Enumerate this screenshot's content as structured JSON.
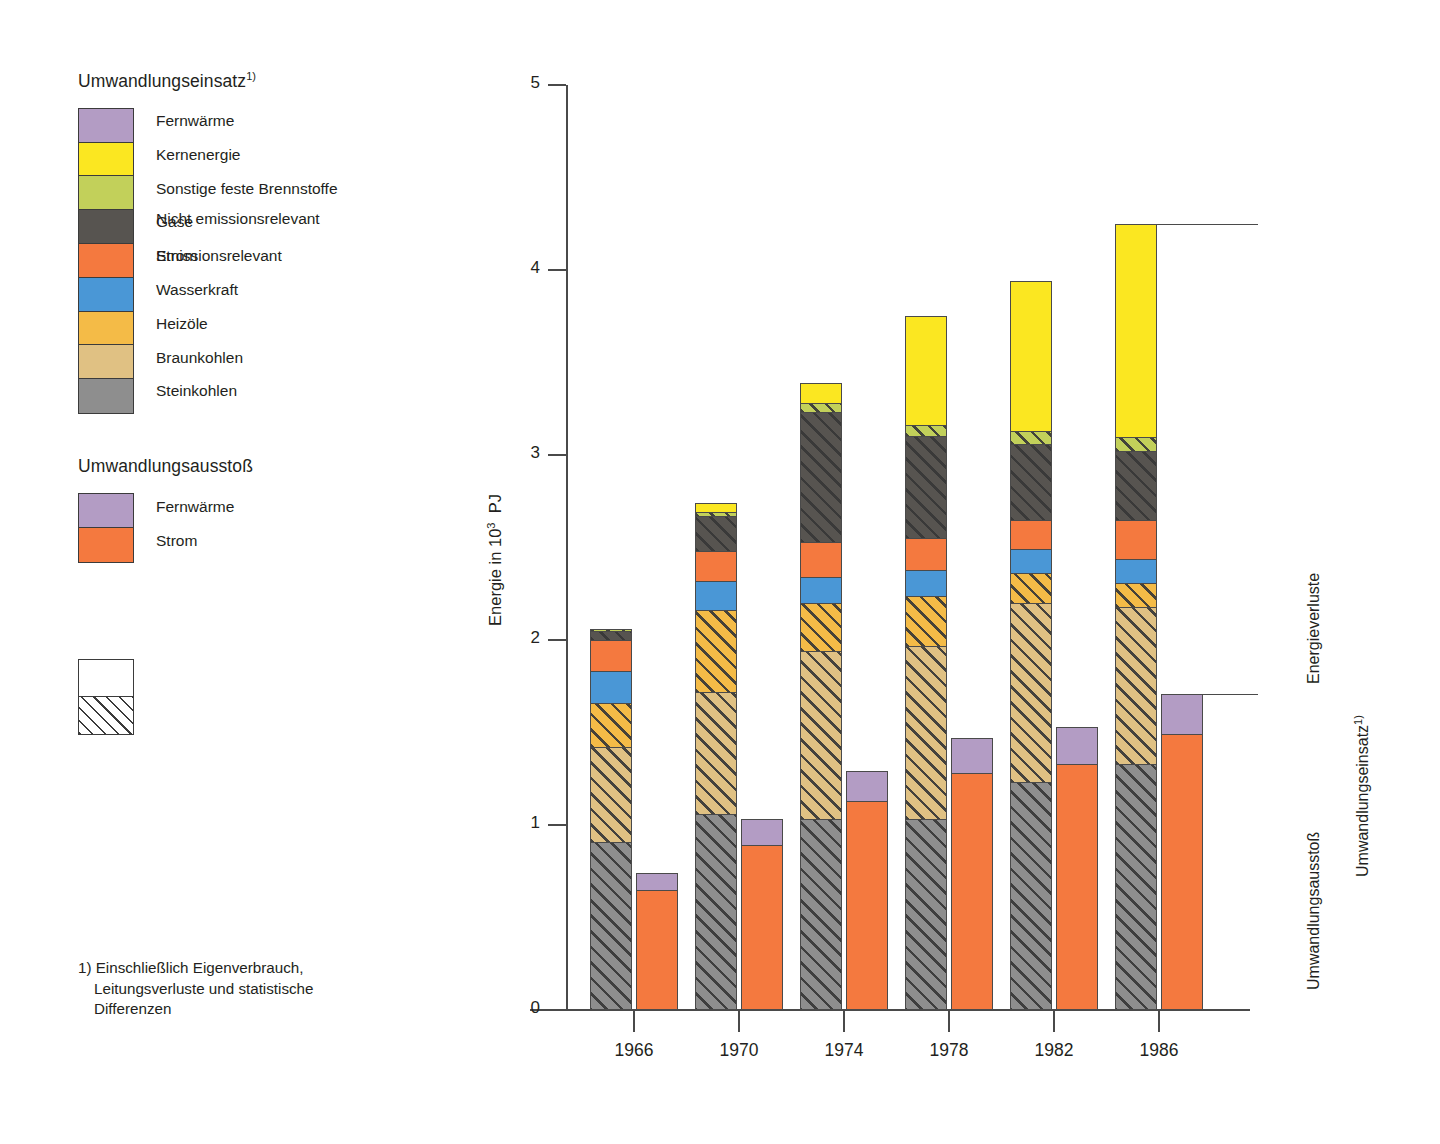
{
  "legend": {
    "group1_title": "Umwandlungseinsatz",
    "group1_title_sup": "1)",
    "group1_items": [
      {
        "label": "Fernwärme",
        "color": "#b39cc4"
      },
      {
        "label": "Kernenergie",
        "color": "#fbe721"
      },
      {
        "label": "Sonstige feste Brennstoffe",
        "color": "#c2d05a"
      },
      {
        "label": "Gase",
        "color": "#575450"
      },
      {
        "label": "Strom",
        "color": "#f4793f"
      },
      {
        "label": "Wasserkraft",
        "color": "#4a97d6"
      },
      {
        "label": "Heizöle",
        "color": "#f4bb47"
      },
      {
        "label": "Braunkohlen",
        "color": "#e0c183"
      },
      {
        "label": "Steinkohlen",
        "color": "#8e8e8e"
      }
    ],
    "group2_title": "Umwandlungsausstoß",
    "group2_items": [
      {
        "label": "Fernwärme",
        "color": "#b39cc4"
      },
      {
        "label": "Strom",
        "color": "#f4793f"
      }
    ],
    "pattern_items": [
      {
        "label": "Nicht emissionsrelevant",
        "pattern": "plain"
      },
      {
        "label": "Emissionsrelevant",
        "pattern": "hatched"
      }
    ]
  },
  "footnote": {
    "line1": "1) Einschließlich Eigenverbrauch,",
    "line2": "Leitungsverluste und statistische",
    "line3": "Differenzen"
  },
  "annotations": {
    "energieverluste": "Energieverluste",
    "umwandlungseinsatz": "Umwandlungseinsatz",
    "umwandlungseinsatz_sup": "1)",
    "umwandlungsausstoss": "Umwandlungsausstoß"
  },
  "chart_data": {
    "type": "bar",
    "title": "",
    "subtitle": "",
    "xlabel": "",
    "ylabel": "Energie in 10³ PJ",
    "ylabel_text": "Energie in 10",
    "ylabel_exp": "3",
    "ylabel_unit": "PJ",
    "ylim": [
      0,
      5
    ],
    "yticks": [
      0,
      1,
      2,
      3,
      4,
      5
    ],
    "ytick_labels": [
      "0",
      "1",
      "2",
      "3",
      "4",
      "5"
    ],
    "grid": false,
    "legend_position": "left-outside",
    "categories": [
      "1966",
      "1970",
      "1974",
      "1978",
      "1982",
      "1986"
    ],
    "stack_order_input": [
      "Steinkohlen",
      "Braunkohlen",
      "Heizöle",
      "Wasserkraft",
      "Strom",
      "Gase",
      "Sonstige feste Brennstoffe",
      "Kernenergie"
    ],
    "stack_order_output": [
      "Strom",
      "Fernwärme"
    ],
    "series": [
      {
        "name": "Umwandlungseinsatz",
        "group": "input",
        "stacks": [
          {
            "category": "1966",
            "total": 2.06,
            "segments": [
              {
                "name": "Steinkohlen",
                "value": 0.91,
                "color": "#8e8e8e",
                "emission": true
              },
              {
                "name": "Braunkohlen",
                "value": 0.51,
                "color": "#e0c183",
                "emission": true
              },
              {
                "name": "Heizöle",
                "value": 0.24,
                "color": "#f4bb47",
                "emission": true
              },
              {
                "name": "Wasserkraft",
                "value": 0.17,
                "color": "#4a97d6",
                "emission": false
              },
              {
                "name": "Strom",
                "value": 0.17,
                "color": "#f4793f",
                "emission": false
              },
              {
                "name": "Gase",
                "value": 0.05,
                "color": "#575450",
                "emission": true
              },
              {
                "name": "Sonstige feste Brennstoffe",
                "value": 0.01,
                "color": "#c2d05a",
                "emission": true
              },
              {
                "name": "Kernenergie",
                "value": 0.0,
                "color": "#fbe721",
                "emission": false
              }
            ]
          },
          {
            "category": "1970",
            "total": 2.74,
            "segments": [
              {
                "name": "Steinkohlen",
                "value": 1.06,
                "color": "#8e8e8e",
                "emission": true
              },
              {
                "name": "Braunkohlen",
                "value": 0.66,
                "color": "#e0c183",
                "emission": true
              },
              {
                "name": "Heizöle",
                "value": 0.44,
                "color": "#f4bb47",
                "emission": true
              },
              {
                "name": "Wasserkraft",
                "value": 0.16,
                "color": "#4a97d6",
                "emission": false
              },
              {
                "name": "Strom",
                "value": 0.16,
                "color": "#f4793f",
                "emission": false
              },
              {
                "name": "Gase",
                "value": 0.19,
                "color": "#575450",
                "emission": true
              },
              {
                "name": "Sonstige feste Brennstoffe",
                "value": 0.02,
                "color": "#c2d05a",
                "emission": true
              },
              {
                "name": "Kernenergie",
                "value": 0.05,
                "color": "#fbe721",
                "emission": false
              }
            ]
          },
          {
            "category": "1974",
            "total": 3.39,
            "segments": [
              {
                "name": "Steinkohlen",
                "value": 1.03,
                "color": "#8e8e8e",
                "emission": true
              },
              {
                "name": "Braunkohlen",
                "value": 0.91,
                "color": "#e0c183",
                "emission": true
              },
              {
                "name": "Heizöle",
                "value": 0.26,
                "color": "#f4bb47",
                "emission": true
              },
              {
                "name": "Wasserkraft",
                "value": 0.14,
                "color": "#4a97d6",
                "emission": false
              },
              {
                "name": "Strom",
                "value": 0.19,
                "color": "#f4793f",
                "emission": false
              },
              {
                "name": "Gase",
                "value": 0.7,
                "color": "#575450",
                "emission": true
              },
              {
                "name": "Sonstige feste Brennstoffe",
                "value": 0.05,
                "color": "#c2d05a",
                "emission": true
              },
              {
                "name": "Kernenergie",
                "value": 0.11,
                "color": "#fbe721",
                "emission": false
              }
            ]
          },
          {
            "category": "1978",
            "total": 3.75,
            "segments": [
              {
                "name": "Steinkohlen",
                "value": 1.03,
                "color": "#8e8e8e",
                "emission": true
              },
              {
                "name": "Braunkohlen",
                "value": 0.94,
                "color": "#e0c183",
                "emission": true
              },
              {
                "name": "Heizöle",
                "value": 0.27,
                "color": "#f4bb47",
                "emission": true
              },
              {
                "name": "Wasserkraft",
                "value": 0.14,
                "color": "#4a97d6",
                "emission": false
              },
              {
                "name": "Strom",
                "value": 0.17,
                "color": "#f4793f",
                "emission": false
              },
              {
                "name": "Gase",
                "value": 0.55,
                "color": "#575450",
                "emission": true
              },
              {
                "name": "Sonstige feste Brennstoffe",
                "value": 0.06,
                "color": "#c2d05a",
                "emission": true
              },
              {
                "name": "Kernenergie",
                "value": 0.59,
                "color": "#fbe721",
                "emission": false
              }
            ]
          },
          {
            "category": "1982",
            "total": 3.94,
            "segments": [
              {
                "name": "Steinkohlen",
                "value": 1.23,
                "color": "#8e8e8e",
                "emission": true
              },
              {
                "name": "Braunkohlen",
                "value": 0.97,
                "color": "#e0c183",
                "emission": true
              },
              {
                "name": "Heizöle",
                "value": 0.16,
                "color": "#f4bb47",
                "emission": true
              },
              {
                "name": "Wasserkraft",
                "value": 0.13,
                "color": "#4a97d6",
                "emission": false
              },
              {
                "name": "Strom",
                "value": 0.16,
                "color": "#f4793f",
                "emission": false
              },
              {
                "name": "Gase",
                "value": 0.41,
                "color": "#575450",
                "emission": true
              },
              {
                "name": "Sonstige feste Brennstoffe",
                "value": 0.07,
                "color": "#c2d05a",
                "emission": true
              },
              {
                "name": "Kernenergie",
                "value": 0.81,
                "color": "#fbe721",
                "emission": false
              }
            ]
          },
          {
            "category": "1986",
            "total": 4.25,
            "segments": [
              {
                "name": "Steinkohlen",
                "value": 1.33,
                "color": "#8e8e8e",
                "emission": true
              },
              {
                "name": "Braunkohlen",
                "value": 0.85,
                "color": "#e0c183",
                "emission": true
              },
              {
                "name": "Heizöle",
                "value": 0.13,
                "color": "#f4bb47",
                "emission": true
              },
              {
                "name": "Wasserkraft",
                "value": 0.13,
                "color": "#4a97d6",
                "emission": false
              },
              {
                "name": "Strom",
                "value": 0.21,
                "color": "#f4793f",
                "emission": false
              },
              {
                "name": "Gase",
                "value": 0.37,
                "color": "#575450",
                "emission": true
              },
              {
                "name": "Sonstige feste Brennstoffe",
                "value": 0.08,
                "color": "#c2d05a",
                "emission": true
              },
              {
                "name": "Kernenergie",
                "value": 1.15,
                "color": "#fbe721",
                "emission": false
              }
            ]
          }
        ]
      },
      {
        "name": "Umwandlungsausstoß",
        "group": "output",
        "stacks": [
          {
            "category": "1966",
            "total": 0.74,
            "segments": [
              {
                "name": "Strom",
                "value": 0.65,
                "color": "#f4793f",
                "emission": false
              },
              {
                "name": "Fernwärme",
                "value": 0.09,
                "color": "#b39cc4",
                "emission": false
              }
            ]
          },
          {
            "category": "1970",
            "total": 1.03,
            "segments": [
              {
                "name": "Strom",
                "value": 0.89,
                "color": "#f4793f",
                "emission": false
              },
              {
                "name": "Fernwärme",
                "value": 0.14,
                "color": "#b39cc4",
                "emission": false
              }
            ]
          },
          {
            "category": "1974",
            "total": 1.29,
            "segments": [
              {
                "name": "Strom",
                "value": 1.13,
                "color": "#f4793f",
                "emission": false
              },
              {
                "name": "Fernwärme",
                "value": 0.16,
                "color": "#b39cc4",
                "emission": false
              }
            ]
          },
          {
            "category": "1978",
            "total": 1.47,
            "segments": [
              {
                "name": "Strom",
                "value": 1.28,
                "color": "#f4793f",
                "emission": false
              },
              {
                "name": "Fernwärme",
                "value": 0.19,
                "color": "#b39cc4",
                "emission": false
              }
            ]
          },
          {
            "category": "1982",
            "total": 1.53,
            "segments": [
              {
                "name": "Strom",
                "value": 1.33,
                "color": "#f4793f",
                "emission": false
              },
              {
                "name": "Fernwärme",
                "value": 0.2,
                "color": "#b39cc4",
                "emission": false
              }
            ]
          },
          {
            "category": "1986",
            "total": 1.71,
            "segments": [
              {
                "name": "Strom",
                "value": 1.49,
                "color": "#f4793f",
                "emission": false
              },
              {
                "name": "Fernwärme",
                "value": 0.22,
                "color": "#b39cc4",
                "emission": false
              }
            ]
          }
        ]
      }
    ]
  }
}
